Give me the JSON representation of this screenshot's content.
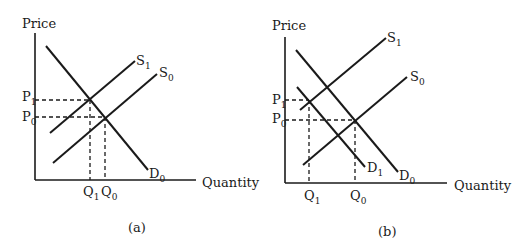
{
  "panels": [
    {
      "id": "a",
      "caption": "(a)",
      "y_axis_label": "Price",
      "x_axis_label": "Quantity",
      "curves": [
        {
          "name": "D",
          "sub": "0",
          "type": "demand"
        },
        {
          "name": "S",
          "sub": "1",
          "type": "supply"
        },
        {
          "name": "S",
          "sub": "0",
          "type": "supply"
        }
      ],
      "price_levels": [
        {
          "name": "P",
          "sub": "1"
        },
        {
          "name": "P",
          "sub": "0"
        }
      ],
      "quantity_levels": [
        {
          "name": "Q",
          "sub": "1"
        },
        {
          "name": "Q",
          "sub": "0"
        }
      ]
    },
    {
      "id": "b",
      "caption": "(b)",
      "y_axis_label": "Price",
      "x_axis_label": "Quantity",
      "curves": [
        {
          "name": "D",
          "sub": "0",
          "type": "demand"
        },
        {
          "name": "D",
          "sub": "1",
          "type": "demand"
        },
        {
          "name": "S",
          "sub": "1",
          "type": "supply"
        },
        {
          "name": "S",
          "sub": "0",
          "type": "supply"
        }
      ],
      "price_levels": [
        {
          "name": "P",
          "sub": "1"
        },
        {
          "name": "P",
          "sub": "0"
        }
      ],
      "quantity_levels": [
        {
          "name": "Q",
          "sub": "1"
        },
        {
          "name": "Q",
          "sub": "0"
        }
      ]
    }
  ]
}
